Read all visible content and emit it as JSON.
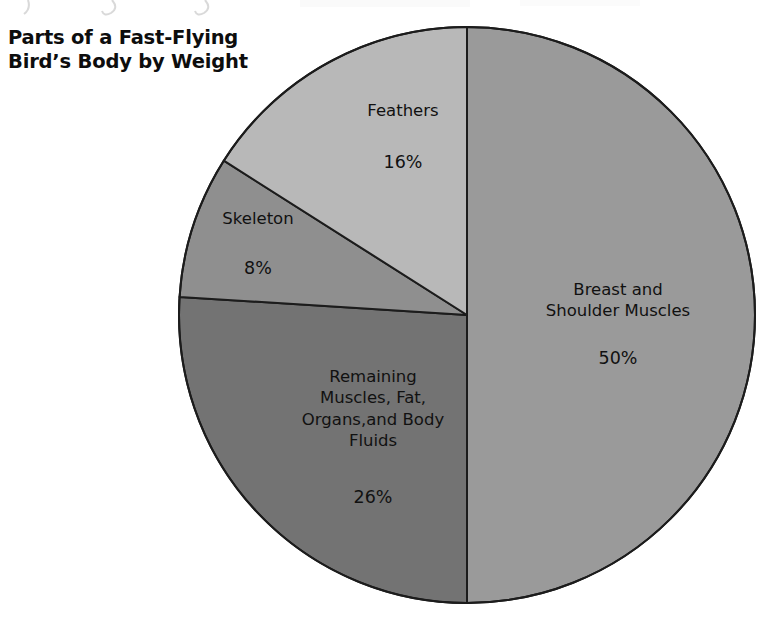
{
  "page": {
    "background_color": "#ffffff",
    "width": 770,
    "height": 631
  },
  "title": {
    "text": "Parts of a Fast-Flying\nBird’s Body by Weight",
    "color": "#0d0d0d"
  },
  "chart_data": {
    "type": "pie",
    "title": "Parts of a Fast-Flying Bird’s Body by Weight",
    "xlabel": "",
    "ylabel": "",
    "legend_position": "none",
    "grid": false,
    "units": "percent of body weight",
    "start_angle_deg": 0,
    "direction": "clockwise",
    "categories": [
      "Breast and Shoulder Muscles",
      "Remaining Muscles, Fat, Organs,and Body Fluids",
      "Skeleton",
      "Feathers"
    ],
    "values": [
      50,
      26,
      8,
      16
    ],
    "slices": [
      {
        "label": "Breast and\nShoulder Muscles",
        "label_flat": "Breast and Shoulder Muscles",
        "value": 50,
        "value_label": "50%",
        "color": "#9a9a9a",
        "start_deg": 0,
        "end_deg": 180
      },
      {
        "label": "Remaining\nMuscles, Fat,\nOrgans,and Body\nFluids",
        "label_flat": "Remaining Muscles, Fat, Organs,and Body Fluids",
        "value": 26,
        "value_label": "26%",
        "color": "#737373",
        "start_deg": 180,
        "end_deg": 273.6
      },
      {
        "label": "Skeleton",
        "label_flat": "Skeleton",
        "value": 8,
        "value_label": "8%",
        "color": "#8f8f8f",
        "start_deg": 273.6,
        "end_deg": 302.4
      },
      {
        "label": "Feathers",
        "label_flat": "Feathers",
        "value": 16,
        "value_label": "16%",
        "color": "#b8b8b8",
        "start_deg": 302.4,
        "end_deg": 360
      }
    ],
    "outline_color": "#1c1c1c",
    "outline_width": 2
  },
  "geometry": {
    "center_x": 467,
    "center_y": 315,
    "radius": 288
  }
}
